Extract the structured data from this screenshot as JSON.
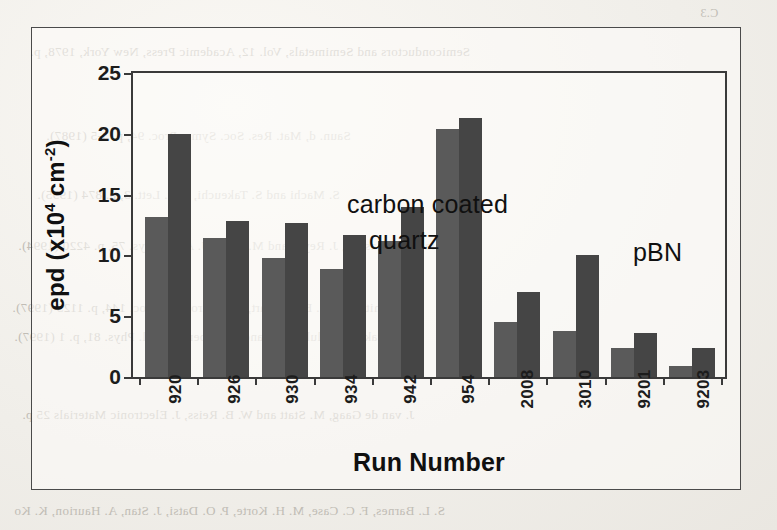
{
  "page": {
    "background_color": "#f0eee9",
    "bleed_through_lines": [
      {
        "text": "C.3",
        "x": 700,
        "y": 6,
        "size": 12
      },
      {
        "text": "Semiconductors and Semimetals, Vol. 12, Academic Press, New York, 1978, p.",
        "x": 30,
        "y": 44,
        "size": 13
      },
      {
        "text": "Saun. d, Mat. Res. Soc. Symp. Proc. 94, p. 3-5 (1987).",
        "x": 46,
        "y": 128,
        "size": 13
      },
      {
        "text": "S. Machi and S. Takeuchi, Mat. Lett. 3, p. 874 (1995).",
        "x": 37,
        "y": 187,
        "size": 13
      },
      {
        "text": "J. Jiang, H. Kasuga, J. Reyes and M. Sakai, J. Appl. Phys. 75, p. 4220 (1994).",
        "x": 18,
        "y": 238,
        "size": 13
      },
      {
        "text": "Smith and M. Bessenhart, J. Electrochem. Soc. 144, p. 1123 (1997).",
        "x": 12,
        "y": 300,
        "size": 13
      },
      {
        "text": "Nowak, W. Walukiewicz and E. Weber, J. Appl. Phys. 81, p. 1 (1997).",
        "x": 14,
        "y": 329,
        "size": 13
      },
      {
        "text": "J. van de Gaag, M. Statt and W. B. Reiss, J. Electronic Materials 25 p.",
        "x": 22,
        "y": 407,
        "size": 13
      },
      {
        "text": "S. L. Barnes, F. C. Case, M. H. Korte, P. O. Datsi, J. Stan, A. Haurion, K. Ko",
        "x": 14,
        "y": 503,
        "size": 13
      }
    ]
  },
  "figure": {
    "title": "",
    "annotations": [
      {
        "id": "carbon",
        "text": "carbon coated"
      },
      {
        "id": "quartz",
        "text": "quartz"
      },
      {
        "id": "pbn",
        "text": "pBN"
      }
    ]
  },
  "chart_data": {
    "type": "bar",
    "title": "",
    "xlabel": "Run Number",
    "ylabel": "epd (x10⁴ cm⁻²)",
    "ylabel_parts": {
      "prefix": "epd (x10",
      "exp1": "4",
      "mid": " cm",
      "exp2": "-2",
      "suffix": ")"
    },
    "categories": [
      "920",
      "926",
      "930",
      "934",
      "942",
      "954",
      "2008",
      "3010",
      "9201",
      "9203"
    ],
    "series": [
      {
        "name": "light",
        "color": "#5a5a5a",
        "values": [
          13.2,
          11.4,
          9.8,
          8.9,
          11.2,
          20.4,
          4.5,
          3.8,
          2.4,
          0.9
        ]
      },
      {
        "name": "dark",
        "color": "#454545",
        "values": [
          20.0,
          12.8,
          12.7,
          11.7,
          14.0,
          21.3,
          7.0,
          10.0,
          3.6,
          2.4
        ]
      }
    ],
    "ylim": [
      0,
      25
    ],
    "yticks": [
      0,
      5,
      10,
      15,
      20,
      25
    ],
    "ytick_labels": [
      "0",
      "5",
      "10",
      "15",
      "20",
      "25"
    ],
    "grid": false,
    "legend": "none",
    "xtick_rotation": -90
  }
}
